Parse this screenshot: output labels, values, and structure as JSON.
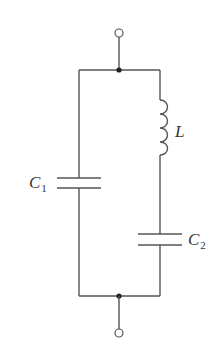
{
  "diagram": {
    "type": "circuit-schematic",
    "components": {
      "inductor": {
        "symbol": "L",
        "subscript": ""
      },
      "capacitor1": {
        "symbol": "C",
        "subscript": "1"
      },
      "capacitor2": {
        "symbol": "C",
        "subscript": "2"
      }
    },
    "terminals": [
      {
        "name": "top-terminal"
      },
      {
        "name": "bottom-terminal"
      }
    ],
    "branches": [
      {
        "name": "left-branch",
        "elements": [
          "C1"
        ]
      },
      {
        "name": "right-branch",
        "elements": [
          "L",
          "C2"
        ]
      }
    ],
    "colors": {
      "wire": "#555555",
      "node": "#222222",
      "label": "#333333",
      "background": "#ffffff"
    }
  }
}
